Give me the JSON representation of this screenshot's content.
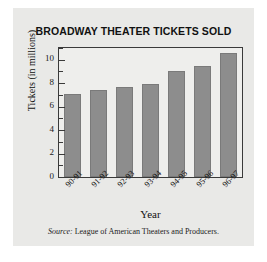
{
  "chart_data": {
    "type": "bar",
    "title": "BROADWAY THEATER TICKETS SOLD",
    "xlabel": "Year",
    "ylabel": "Tickets (in millions)",
    "categories": [
      "90-91",
      "91-92",
      "92-93",
      "93-94",
      "94-95",
      "95-96",
      "96-97"
    ],
    "values": [
      7.1,
      7.4,
      7.7,
      7.9,
      9.0,
      9.5,
      10.6
    ],
    "ylim": [
      0,
      11
    ],
    "yticks": [
      0,
      2,
      4,
      6,
      8,
      10
    ],
    "ytick_labels": [
      "0",
      "2",
      "4",
      "6",
      "8",
      "10"
    ],
    "yminor_ticks": [
      1,
      3,
      5,
      7,
      9,
      11
    ],
    "grid": false,
    "legend": null,
    "bar_color": "#8d8d8d",
    "plot_background": "#eeeeec",
    "panel_background": "#e9e9e7"
  },
  "source": {
    "label": "Source:",
    "text": "League of American Theaters and Producers."
  }
}
